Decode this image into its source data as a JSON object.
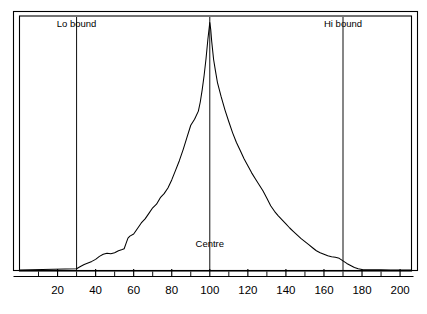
{
  "chart_data": {
    "type": "line",
    "title": "",
    "subtitle": "",
    "xlabel": "",
    "ylabel": "",
    "xlim": [
      0,
      206
    ],
    "ylim": [
      0,
      100
    ],
    "grid": false,
    "legend_position": "none",
    "axis_tick_labels": [
      "20",
      "40",
      "60",
      "80",
      "100",
      "120",
      "140",
      "160",
      "180",
      "200"
    ],
    "axis_tick_label_values": [
      20,
      40,
      60,
      80,
      100,
      120,
      140,
      160,
      180,
      200
    ],
    "minor_tick_values": [
      10,
      30,
      50,
      70,
      90,
      110,
      130,
      150,
      170,
      190
    ],
    "tick_interval": 10,
    "annotations": [
      {
        "label": "Lo bound",
        "x": 30,
        "label_y": 96
      },
      {
        "label": "Centre",
        "x": 100,
        "label_y": 9
      },
      {
        "label": "Hi bound",
        "x": 170,
        "label_y": 96
      }
    ],
    "series": [
      {
        "name": "distribution",
        "color": "#000000",
        "x": [
          30,
          32,
          34,
          36,
          38,
          40,
          42,
          44,
          46,
          48,
          50,
          52,
          54,
          55,
          56,
          57,
          58,
          60,
          62,
          64,
          66,
          68,
          70,
          72,
          74,
          76,
          78,
          80,
          82,
          84,
          86,
          88,
          90,
          92,
          94,
          95,
          96,
          97,
          98,
          99,
          100,
          100.5,
          101,
          102,
          103,
          104,
          106,
          108,
          110,
          112,
          114,
          116,
          118,
          120,
          122,
          124,
          126,
          128,
          130,
          132,
          134,
          136,
          138,
          140,
          142,
          144,
          146,
          148,
          150,
          152,
          154,
          156,
          158,
          160,
          162,
          164,
          166,
          168,
          170,
          172,
          174,
          176,
          178,
          180,
          185,
          190,
          195,
          200,
          204
        ],
        "y": [
          0.5,
          1.4,
          2.2,
          2.8,
          3.4,
          4.2,
          5.4,
          6.2,
          6.6,
          6.4,
          6.8,
          7.6,
          8.1,
          8.4,
          10.5,
          12.6,
          13.4,
          14.2,
          16.4,
          18.6,
          20.2,
          22.4,
          24.6,
          26.0,
          28.6,
          30.2,
          32.4,
          35.6,
          39.4,
          43.2,
          47.6,
          52.4,
          57.2,
          59.6,
          62.8,
          66.4,
          71.2,
          76.8,
          83.4,
          91.2,
          97.8,
          95.0,
          90.4,
          83.2,
          78.6,
          74.2,
          68.4,
          63.2,
          58.6,
          54.2,
          50.4,
          47.2,
          44.0,
          41.2,
          38.4,
          36.0,
          33.6,
          31.2,
          28.4,
          25.4,
          23.2,
          21.4,
          19.8,
          18.2,
          16.6,
          15.2,
          13.8,
          12.4,
          11.2,
          10.0,
          8.8,
          7.6,
          6.8,
          6.2,
          5.6,
          5.2,
          5.0,
          4.6,
          3.6,
          2.6,
          1.8,
          1.0,
          0.5,
          0.2,
          0.1,
          0.05,
          0.0,
          0.0,
          0.0
        ]
      }
    ]
  },
  "frame": {
    "outer_border_color": "#000000",
    "inner_border_color": "#000000"
  },
  "axis": {
    "line_color": "#000000",
    "tick_color": "#000000"
  }
}
